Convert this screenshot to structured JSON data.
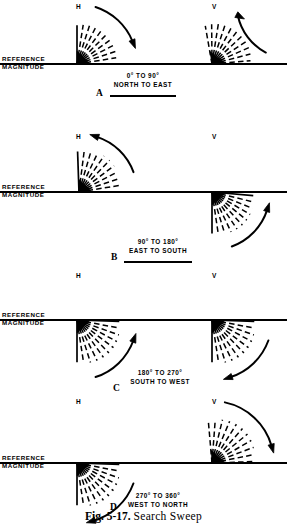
{
  "figure": {
    "caption_prefix": "Fig. 5-17.",
    "caption_title": "Search Sweep"
  },
  "labels": {
    "reference_line1": "REFERENCE",
    "reference_line2": "MAGNITUDE",
    "horizontal_marker": "H",
    "vertical_marker": "V"
  },
  "panels": [
    {
      "id": "A",
      "letter": "A",
      "range": "0° TO 90°",
      "directions": "NORTH TO EAST",
      "baseline_y": 64,
      "letter_x": 96,
      "letter_y": 88,
      "caption_x": 143,
      "caption_y": 72,
      "underline_x": 110,
      "underline_y": 95,
      "underline_w": 66,
      "clusters": [
        {
          "marker": "H",
          "marker_x": 76,
          "marker_y": 3,
          "origin_x": 77,
          "origin_y": 64,
          "start_angle": 90,
          "end_angle": 0,
          "length": 42,
          "solid_first": true,
          "arrow": {
            "cx": 77,
            "cy": 64,
            "r": 60,
            "a_start": 72,
            "a_end": 22,
            "head_at": "end",
            "sweep": "cw"
          }
        },
        {
          "marker": "V",
          "marker_x": 212,
          "marker_y": 3,
          "origin_x": 212,
          "origin_y": 64,
          "start_angle": 100,
          "end_angle": 5,
          "length": 42,
          "solid_first": false,
          "arrow": {
            "cx": 212,
            "cy": 64,
            "r": 55,
            "a_start": 62,
            "a_end": 12,
            "head_at": "start",
            "sweep": "ccw"
          }
        }
      ]
    },
    {
      "id": "B",
      "letter": "B",
      "range": "90° TO 180°",
      "directions": "EAST TO SOUTH",
      "baseline_y": 192,
      "letter_x": 111,
      "letter_y": 252,
      "caption_x": 158,
      "caption_y": 238,
      "underline_x": 124,
      "underline_y": 261,
      "underline_w": 68,
      "clusters": [
        {
          "marker": "H",
          "marker_x": 76,
          "marker_y": 133,
          "origin_x": 79,
          "origin_y": 192,
          "start_angle": 92,
          "end_angle": 0,
          "length": 44,
          "solid_first": true,
          "arrow": {
            "cx": 79,
            "cy": 192,
            "r": 58,
            "a_start": 20,
            "a_end": 72,
            "head_at": "end",
            "sweep": "ccw"
          }
        },
        {
          "marker": "V",
          "marker_x": 212,
          "marker_y": 133,
          "origin_x": 212,
          "origin_y": 192,
          "start_angle": -90,
          "end_angle": -5,
          "length": 45,
          "solid_first": true,
          "arrow": {
            "cx": 212,
            "cy": 192,
            "r": 58,
            "a_start": -70,
            "a_end": -18,
            "head_at": "end",
            "sweep": "ccw"
          }
        }
      ]
    },
    {
      "id": "C",
      "letter": "C",
      "range": "180° TO 270°",
      "directions": "SOUTH TO WEST",
      "baseline_y": 320,
      "letter_x": 113,
      "letter_y": 383,
      "caption_x": 160,
      "caption_y": 369,
      "underline_x": 0,
      "underline_y": 0,
      "underline_w": 0,
      "clusters": [
        {
          "marker": "H",
          "marker_x": 76,
          "marker_y": 272,
          "origin_x": 77,
          "origin_y": 320,
          "start_angle": -90,
          "end_angle": -2,
          "length": 46,
          "solid_first": true,
          "arrow": {
            "cx": 77,
            "cy": 320,
            "r": 60,
            "a_start": -72,
            "a_end": -20,
            "head_at": "end",
            "sweep": "ccw"
          }
        },
        {
          "marker": "V",
          "marker_x": 212,
          "marker_y": 272,
          "origin_x": 212,
          "origin_y": 320,
          "start_angle": -90,
          "end_angle": -2,
          "length": 46,
          "solid_first": true,
          "arrow": {
            "cx": 212,
            "cy": 320,
            "r": 60,
            "a_start": -20,
            "a_end": -72,
            "head_at": "end",
            "sweep": "cw"
          }
        }
      ]
    },
    {
      "id": "D",
      "letter": "D",
      "range": "270° TO 360°",
      "directions": "WEST TO NORTH",
      "baseline_y": 463,
      "letter_x": 110,
      "letter_y": 502,
      "caption_x": 158,
      "caption_y": 492,
      "underline_x": 0,
      "underline_y": 0,
      "underline_w": 0,
      "clusters": [
        {
          "marker": "H",
          "marker_x": 76,
          "marker_y": 398,
          "origin_x": 77,
          "origin_y": 463,
          "start_angle": -90,
          "end_angle": -2,
          "length": 46,
          "solid_first": true,
          "arrow": {
            "cx": 77,
            "cy": 463,
            "r": 60,
            "a_start": -20,
            "a_end": -74,
            "head_at": "end",
            "sweep": "cw"
          }
        },
        {
          "marker": "V",
          "marker_x": 212,
          "marker_y": 398,
          "origin_x": 212,
          "origin_y": 463,
          "start_angle": 95,
          "end_angle": 2,
          "length": 46,
          "solid_first": false,
          "arrow": {
            "cx": 212,
            "cy": 463,
            "r": 62,
            "a_start": 78,
            "a_end": 16,
            "head_at": "end",
            "sweep": "cw"
          }
        }
      ]
    }
  ],
  "style": {
    "ink": "#000000",
    "background": "#ffffff",
    "baseline_x_start": 0,
    "baseline_x_end": 287,
    "ray_count": 11
  }
}
